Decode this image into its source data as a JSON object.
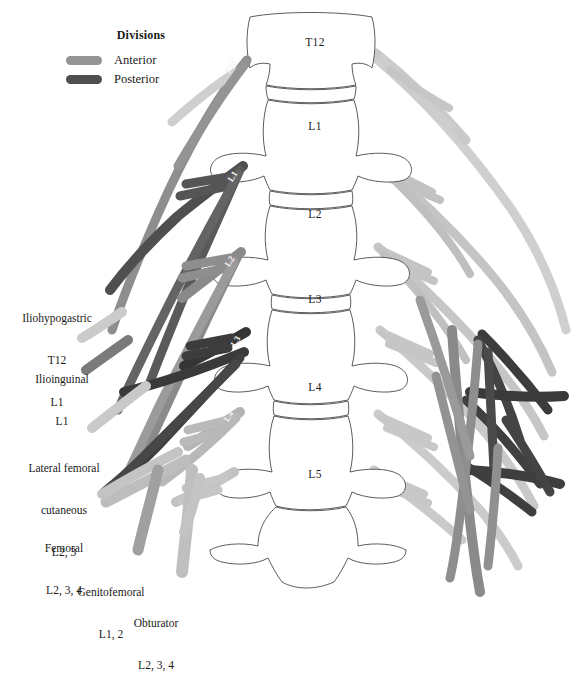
{
  "figure": {
    "background": "#ffffff"
  },
  "legend": {
    "title": "Divisions",
    "items": [
      {
        "label": "Anterior",
        "color": "#949494",
        "swatch_name": "anterior-swatch"
      },
      {
        "label": "Posterior",
        "color": "#4f4f4f",
        "swatch_name": "posterior-swatch"
      }
    ]
  },
  "vertebrae": [
    {
      "id": "T12",
      "label": "T12",
      "cx": 315,
      "cy": 46
    },
    {
      "id": "L1",
      "label": "L1",
      "cx": 315,
      "cy": 130
    },
    {
      "id": "L2",
      "label": "L2",
      "cx": 315,
      "cy": 218
    },
    {
      "id": "L3",
      "label": "L3",
      "cx": 315,
      "cy": 303
    },
    {
      "id": "L4",
      "label": "L4",
      "cx": 315,
      "cy": 391
    },
    {
      "id": "L5",
      "label": "L5",
      "cx": 315,
      "cy": 478
    }
  ],
  "nerve_roots": [
    {
      "id": "T12",
      "label": "T12",
      "x": 233,
      "y": 69,
      "rotate": -58,
      "division": "anterior"
    },
    {
      "id": "L1",
      "label": "L1",
      "x": 235,
      "y": 178,
      "rotate": -58,
      "division": "posterior"
    },
    {
      "id": "L2",
      "label": "L2",
      "x": 232,
      "y": 263,
      "rotate": -58,
      "division": "anterior"
    },
    {
      "id": "L3",
      "label": "L3",
      "x": 238,
      "y": 343,
      "rotate": -58,
      "division": "posterior"
    },
    {
      "id": "L4",
      "label": "L4",
      "x": 231,
      "y": 418,
      "rotate": -58,
      "division": "anterior"
    }
  ],
  "nerve_labels": [
    {
      "name": "iliohypogastric",
      "lines": [
        "Iliohypogastric",
        "T12",
        "L1"
      ],
      "left": 2,
      "top": 283,
      "width": 110
    },
    {
      "name": "ilioinguinal",
      "lines": [
        "Ilioinguinal",
        "L1"
      ],
      "left": 12,
      "top": 344,
      "width": 100
    },
    {
      "name": "lateral-femoral-cutaneous",
      "lines": [
        "Lateral femoral",
        "cutaneous",
        "L2, 3"
      ],
      "left": 6,
      "top": 433,
      "width": 116
    },
    {
      "name": "femoral",
      "lines": [
        "Femoral",
        "L2, 3, 4"
      ],
      "left": 14,
      "top": 513,
      "width": 100
    },
    {
      "name": "genitofemoral",
      "lines": [
        "Genitofemoral",
        "L1, 2"
      ],
      "left": 56,
      "top": 557,
      "width": 110
    },
    {
      "name": "obturator",
      "lines": [
        "Obturator",
        "L2, 3, 4"
      ],
      "left": 106,
      "top": 588,
      "width": 100
    }
  ],
  "colors": {
    "anterior_mid": "#949494",
    "anterior_light": "#bfbfbf",
    "anterior_pale": "#d2d2d2",
    "posterior_dark": "#4f4f4f",
    "posterior_mid": "#6e6e6e",
    "posterior_faint": "#8a8a8a",
    "bone_outline": "#4a4a4a",
    "text": "#1a1a1a"
  }
}
